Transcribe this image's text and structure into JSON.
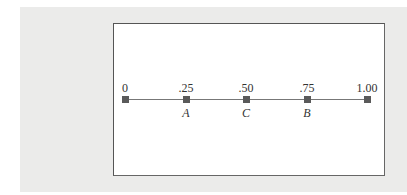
{
  "diagram": {
    "type": "number-line",
    "range": [
      0,
      1.0
    ],
    "ticks": [
      {
        "value": 0,
        "label": "0",
        "point": ""
      },
      {
        "value": 0.25,
        "label": ".25",
        "point": "A"
      },
      {
        "value": 0.5,
        "label": ".50",
        "point": "C"
      },
      {
        "value": 0.75,
        "label": ".75",
        "point": "B"
      },
      {
        "value": 1.0,
        "label": "1.00",
        "point": ""
      }
    ],
    "colors": {
      "panel_background": "#ebebea",
      "frame_background": "#ffffff",
      "frame_border": "#555555",
      "line": "#777777",
      "marker": "#5a5a5a"
    }
  }
}
